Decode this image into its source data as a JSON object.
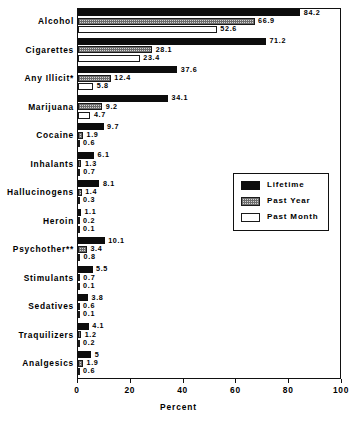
{
  "chart_data": {
    "type": "bar",
    "orientation": "horizontal",
    "title": "",
    "xlabel": "Percent",
    "ylabel": "",
    "xlim": [
      0,
      100
    ],
    "xticks": [
      0,
      20,
      40,
      60,
      80,
      100
    ],
    "xtick_labels": [
      "0",
      "20",
      "40",
      "60",
      "80",
      "100"
    ],
    "grid": false,
    "legend_position": "center-right",
    "categories": [
      "Alcohol",
      "Cigarettes",
      "Any Illicit*",
      "Marijuana",
      "Cocaine",
      "Inhalants",
      "Hallucinogens",
      "Heroin",
      "Psychother**",
      "Stimulants",
      "Sedatives",
      "Traquilizers",
      "Analgesics"
    ],
    "series": [
      {
        "name": "Lifetime",
        "style": "solid-black",
        "values": [
          84.2,
          71.2,
          37.6,
          34.1,
          9.7,
          6.1,
          8.1,
          1.1,
          10.1,
          5.5,
          3.8,
          4.1,
          5
        ],
        "labels": [
          "84.2",
          "71.2",
          "37.6",
          "34.1",
          "9.7",
          "6.1",
          "8.1",
          "1.1",
          "10.1",
          "5.5",
          "3.8",
          "4.1",
          "5"
        ]
      },
      {
        "name": "Past Year",
        "style": "hatched-gray",
        "values": [
          66.9,
          28.1,
          12.4,
          9.2,
          1.9,
          1.3,
          1.4,
          0.2,
          3.4,
          0.7,
          0.6,
          1.2,
          1.9
        ],
        "labels": [
          "66.9",
          "28.1",
          "12.4",
          "9.2",
          "1.9",
          "1.3",
          "1.4",
          "0.2",
          "3.4",
          "0.7",
          "0.6",
          "1.2",
          "1.9"
        ]
      },
      {
        "name": "Past Month",
        "style": "white-outline",
        "values": [
          52.6,
          23.4,
          5.8,
          4.7,
          0.6,
          0.7,
          0.3,
          0.1,
          0.8,
          0.1,
          0.1,
          0.2,
          0.6
        ],
        "labels": [
          "52.6",
          "23.4",
          "5.8",
          "4.7",
          "0.6",
          "0.7",
          "0.3",
          "0.1",
          "0.8",
          "0.1",
          "0.1",
          "0.2",
          "0.6"
        ]
      }
    ]
  },
  "legend": {
    "items": [
      {
        "label": "Lifetime"
      },
      {
        "label": "Past Year"
      },
      {
        "label": "Past Month"
      }
    ]
  },
  "axis": {
    "x_title": "Percent"
  }
}
